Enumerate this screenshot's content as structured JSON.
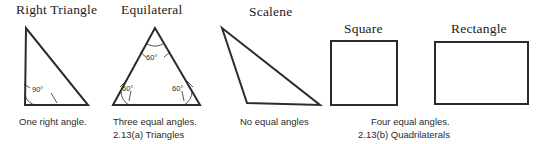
{
  "figure": {
    "background_color": "#ffffff",
    "stroke_color": "#2b2b2b",
    "text_color": "#2b2b2b"
  },
  "triangles": {
    "figure_label": "2.13(a)  Triangles",
    "items": [
      {
        "heading": "Right Triangle",
        "caption": "One right angle.",
        "angles": [
          "90°"
        ]
      },
      {
        "heading": "Equilateral",
        "caption": "Three equal angles.",
        "angles": [
          "60°",
          "60°",
          "60°"
        ]
      },
      {
        "heading": "Scalene",
        "caption": "No equal angles",
        "angles": []
      }
    ]
  },
  "quadrilaterals": {
    "figure_label": "2.13(b)  Quadrilaterals",
    "caption": "Four equal angles.",
    "items": [
      {
        "heading": "Square"
      },
      {
        "heading": "Rectangle"
      }
    ]
  }
}
